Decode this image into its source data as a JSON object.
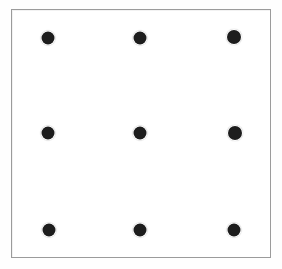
{
  "figure": {
    "name": "nine-dots-puzzle",
    "background_color": "#ffffff",
    "canvas": {
      "width": 282,
      "height": 269
    }
  },
  "frame": {
    "name": "puzzle-frame",
    "border_color": "#9b9b9b",
    "border_width": 1,
    "fill_color": "#ffffff",
    "x": 11,
    "y": 9,
    "width": 260,
    "height": 249
  },
  "grid": {
    "rows": 3,
    "columns": 3,
    "dot_count": 9,
    "dot_color": "#1d1d1d",
    "dot_diameter": 13,
    "column_centers_x": [
      48,
      140,
      234
    ],
    "row_centers_y": [
      38,
      133,
      230
    ]
  },
  "dots": [
    {
      "id": "dot-r1c1",
      "row": 1,
      "column": 1,
      "cx": 48,
      "cy": 38,
      "d": 13
    },
    {
      "id": "dot-r1c2",
      "row": 1,
      "column": 2,
      "cx": 140,
      "cy": 38,
      "d": 13
    },
    {
      "id": "dot-r1c3",
      "row": 1,
      "column": 3,
      "cx": 234,
      "cy": 37,
      "d": 14
    },
    {
      "id": "dot-r2c1",
      "row": 2,
      "column": 1,
      "cx": 48,
      "cy": 133,
      "d": 13
    },
    {
      "id": "dot-r2c2",
      "row": 2,
      "column": 2,
      "cx": 140,
      "cy": 133,
      "d": 13
    },
    {
      "id": "dot-r2c3",
      "row": 2,
      "column": 3,
      "cx": 235,
      "cy": 133,
      "d": 14
    },
    {
      "id": "dot-r3c1",
      "row": 3,
      "column": 1,
      "cx": 49,
      "cy": 230,
      "d": 13
    },
    {
      "id": "dot-r3c2",
      "row": 3,
      "column": 2,
      "cx": 140,
      "cy": 230,
      "d": 13
    },
    {
      "id": "dot-r3c3",
      "row": 3,
      "column": 3,
      "cx": 234,
      "cy": 230,
      "d": 13
    }
  ]
}
